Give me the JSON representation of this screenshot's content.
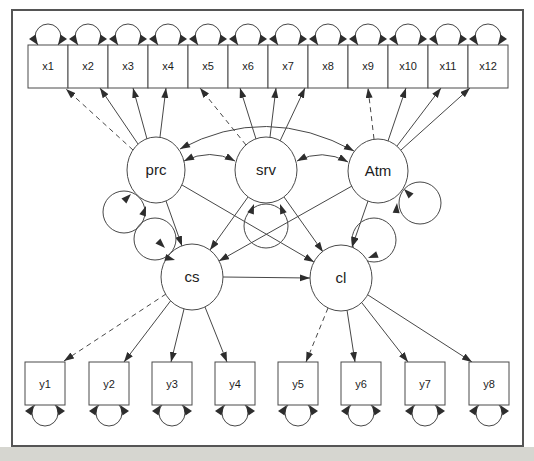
{
  "figure": {
    "type": "structural-equation-model-path-diagram",
    "colors": {
      "background": "#ffffff",
      "outside_strip": "#d6d6d0",
      "line": "#474747",
      "arrowhead": "#2d2d2d",
      "node_fill": "#ffffff",
      "border": "#555555"
    },
    "latents": [
      {
        "id": "prc",
        "label": "prc"
      },
      {
        "id": "srv",
        "label": "srv"
      },
      {
        "id": "Atm",
        "label": "Atm"
      },
      {
        "id": "cs",
        "label": "cs"
      },
      {
        "id": "cl",
        "label": "cl"
      }
    ],
    "x_indicators": [
      {
        "label": "x1"
      },
      {
        "label": "x2"
      },
      {
        "label": "x3"
      },
      {
        "label": "x4"
      },
      {
        "label": "x5"
      },
      {
        "label": "x6"
      },
      {
        "label": "x7"
      },
      {
        "label": "x8"
      },
      {
        "label": "x9"
      },
      {
        "label": "x10"
      },
      {
        "label": "x11"
      },
      {
        "label": "x12"
      }
    ],
    "y_indicators": [
      {
        "label": "y1"
      },
      {
        "label": "y2"
      },
      {
        "label": "y3"
      },
      {
        "label": "y4"
      },
      {
        "label": "y5"
      },
      {
        "label": "y6"
      },
      {
        "label": "y7"
      },
      {
        "label": "y8"
      }
    ],
    "model": {
      "loadings": {
        "prc": [
          "x1",
          "x2",
          "x3",
          "x4"
        ],
        "srv": [
          "x5",
          "x6",
          "x7",
          "x8"
        ],
        "Atm": [
          "x9",
          "x10",
          "x11",
          "x12"
        ],
        "cs": [
          "y1",
          "y2",
          "y3",
          "y4"
        ],
        "cl": [
          "y5",
          "y6",
          "y7",
          "y8"
        ]
      },
      "dashed_loadings": [
        "prc → x1",
        "srv → x5",
        "Atm → x9",
        "cs → y1",
        "cl → y5"
      ],
      "structural_paths": [
        "prc → cs",
        "srv → cs",
        "Atm → cs",
        "prc → cl",
        "srv → cl",
        "Atm → cl",
        "cs → cl"
      ],
      "covariances": [
        "prc ↔ srv",
        "srv ↔ Atm",
        "prc ↔ Atm"
      ],
      "variance_loops": [
        "prc",
        "srv",
        "Atm",
        "cs",
        "cl",
        "all x indicators",
        "all y indicators"
      ]
    }
  }
}
